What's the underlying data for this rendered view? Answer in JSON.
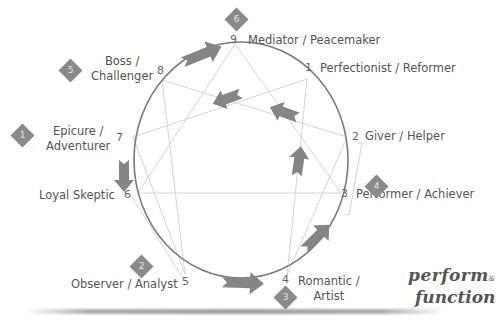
{
  "types": [
    {
      "number": "9",
      "name": "Mediator / Peacemaker",
      "badge": "6"
    },
    {
      "number": "1",
      "name": "Perfectionist / Reformer"
    },
    {
      "number": "2",
      "name": "Giver / Helper"
    },
    {
      "number": "3",
      "name": "Performer / Achiever"
    },
    {
      "number": "4",
      "name_line1": "Romantic /",
      "name_line2": "Artist",
      "badge": "3"
    },
    {
      "number": "5",
      "name": "Observer / Analyst",
      "badge": "2"
    },
    {
      "number": "6",
      "name": "Loyal Skeptic"
    },
    {
      "number": "7",
      "name_line1": "Epicure /",
      "name_line2": "Adventurer",
      "badge": "1"
    },
    {
      "number": "8",
      "name_line1": "Boss /",
      "name_line2": "Challenger",
      "badge": "5"
    }
  ],
  "badges": {
    "b1": "1",
    "b2": "2",
    "b3": "3",
    "b4": "4",
    "b5": "5",
    "b6": "6"
  },
  "logo": {
    "line1": "perform",
    "amp": "&",
    "line2": "function"
  },
  "colors": {
    "circle": "#7a7a7a",
    "lines": "#d0d0d0",
    "arrows": "#808080",
    "badge": "#8a8a8a",
    "text": "#555555"
  }
}
